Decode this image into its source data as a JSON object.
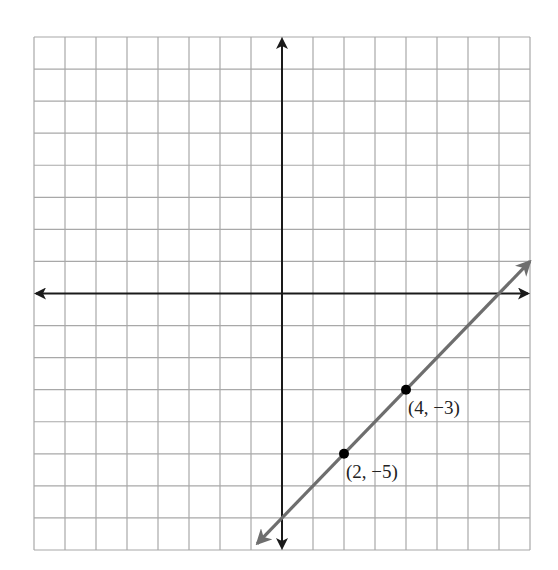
{
  "chart_data": {
    "type": "line",
    "title": "",
    "xlabel": "",
    "ylabel": "",
    "grid": true,
    "xlim": [
      -8,
      8
    ],
    "ylim": [
      -8,
      8
    ],
    "axes": {
      "x_arrows": true,
      "y_arrows": true,
      "tick_labels": false
    },
    "series": [
      {
        "name": "line through (2, -5) and (4, -3)",
        "kind": "line-with-arrows",
        "slope": 1,
        "intercept": -7,
        "x_range": [
          -0.8,
          8
        ],
        "color": "#6e6e6e"
      }
    ],
    "points": [
      {
        "x": 2,
        "y": -5,
        "label": "(2, −5)"
      },
      {
        "x": 4,
        "y": -3,
        "label": "(4, −3)"
      }
    ]
  },
  "colors": {
    "grid": "#a8a8a8",
    "axis": "#1a1a1a",
    "line": "#6e6e6e",
    "point": "#000000"
  }
}
